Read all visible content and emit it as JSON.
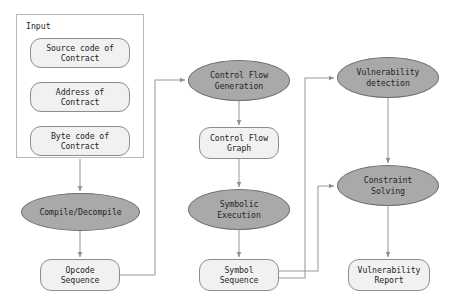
{
  "diagram": {
    "type": "flowchart",
    "canvas": {
      "width": 455,
      "height": 308
    },
    "colors": {
      "process_fill": "#a9a9a9",
      "process_stroke": "#6e6e6e",
      "data_fill": "#f1f1f1",
      "data_stroke": "#8d8d8d",
      "group_stroke": "#b9b9b9",
      "edge_stroke": "#9a9a9a",
      "text": "#262626",
      "background": "#ffffff"
    },
    "group": {
      "label": "Input",
      "x": 16,
      "y": 14,
      "width": 128,
      "height": 144
    },
    "nodes": [
      {
        "id": "source_code",
        "label": "Source code of\nContract",
        "shape": "rounded-rect",
        "x": 30,
        "y": 38,
        "width": 100,
        "height": 30
      },
      {
        "id": "address",
        "label": "Address of\nContract",
        "shape": "rounded-rect",
        "x": 30,
        "y": 82,
        "width": 100,
        "height": 30
      },
      {
        "id": "byte_code",
        "label": "Byte code of\nContract",
        "shape": "rounded-rect",
        "x": 30,
        "y": 126,
        "width": 100,
        "height": 30
      },
      {
        "id": "compile",
        "label": "Compile/Decompile",
        "shape": "ellipse",
        "x": 21,
        "y": 193,
        "width": 119,
        "height": 38
      },
      {
        "id": "opcode_seq",
        "label": "Opcode\nSequence",
        "shape": "rounded-rect",
        "x": 40,
        "y": 259,
        "width": 80,
        "height": 32
      },
      {
        "id": "cfg_gen",
        "label": "Control Flow\nGeneration",
        "shape": "ellipse",
        "x": 188,
        "y": 60,
        "width": 102,
        "height": 41
      },
      {
        "id": "cfg",
        "label": "Control Flow\nGraph",
        "shape": "rounded-rect",
        "x": 199,
        "y": 127,
        "width": 80,
        "height": 32
      },
      {
        "id": "symbolic_exec",
        "label": "Symbolic\nExecution",
        "shape": "ellipse",
        "x": 188,
        "y": 189,
        "width": 102,
        "height": 41
      },
      {
        "id": "symbol_seq",
        "label": "Symbol\nSequence",
        "shape": "rounded-rect",
        "x": 199,
        "y": 259,
        "width": 80,
        "height": 32
      },
      {
        "id": "vuln_detect",
        "label": "Vulnerability\ndetection",
        "shape": "ellipse",
        "x": 337,
        "y": 57,
        "width": 102,
        "height": 41
      },
      {
        "id": "constraint",
        "label": "Constraint\nSolving",
        "shape": "ellipse",
        "x": 337,
        "y": 165,
        "width": 102,
        "height": 41
      },
      {
        "id": "vuln_report",
        "label": "Vulnerability\nReport",
        "shape": "rounded-rect",
        "x": 348,
        "y": 259,
        "width": 82,
        "height": 32
      }
    ],
    "edges": [
      {
        "from": "input_group",
        "to": "compile",
        "kind": "straight-down"
      },
      {
        "from": "compile",
        "to": "opcode_seq",
        "kind": "straight-down"
      },
      {
        "from": "opcode_seq",
        "to": "cfg_gen",
        "kind": "right-up-elbow"
      },
      {
        "from": "cfg_gen",
        "to": "cfg",
        "kind": "straight-down"
      },
      {
        "from": "cfg",
        "to": "symbolic_exec",
        "kind": "straight-down"
      },
      {
        "from": "symbolic_exec",
        "to": "symbol_seq",
        "kind": "straight-down"
      },
      {
        "from": "symbol_seq",
        "to": "vuln_detect",
        "kind": "right-up-elbow"
      },
      {
        "from": "symbol_seq",
        "to": "constraint",
        "kind": "right-up-elbow"
      },
      {
        "from": "vuln_detect",
        "to": "constraint",
        "kind": "straight-down"
      },
      {
        "from": "constraint",
        "to": "vuln_report",
        "kind": "straight-down"
      }
    ]
  }
}
